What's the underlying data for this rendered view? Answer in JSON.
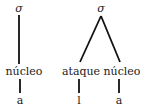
{
  "trees": [
    {
      "root": {
        "label": "σ"
      },
      "children": [
        {
          "label": "núcleo",
          "child": {
            "label": "a"
          }
        }
      ]
    },
    {
      "root": {
        "label": "σ"
      },
      "children": [
        {
          "label": "ataque",
          "child": {
            "label": "l"
          }
        },
        {
          "label": "núcleo",
          "child": {
            "label": "a"
          }
        }
      ]
    }
  ]
}
